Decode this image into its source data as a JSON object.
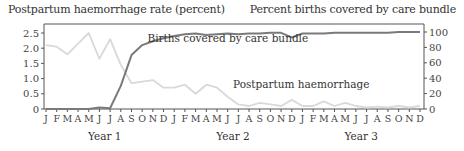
{
  "chart_data": {
    "type": "line",
    "title": "",
    "left_axis": {
      "label": "Postpartum haemorrhage rate (percent)",
      "ticks": [
        0,
        0.5,
        1.0,
        1.5,
        2.0,
        2.5
      ],
      "tick_labels": [
        "0",
        "0.5",
        "1.0",
        "1.5",
        "2.0",
        "2.5"
      ],
      "ylim": [
        0,
        2.6
      ]
    },
    "right_axis": {
      "label": "Percent births covered by care bundle",
      "ticks": [
        0,
        20,
        40,
        60,
        80,
        100
      ],
      "tick_labels": [
        "0",
        "20",
        "40",
        "60",
        "80",
        "100"
      ],
      "ylim": [
        0,
        104
      ]
    },
    "x": [
      "J",
      "F",
      "M",
      "A",
      "M",
      "J",
      "J",
      "A",
      "S",
      "O",
      "N",
      "D",
      "J",
      "F",
      "M",
      "A",
      "M",
      "J",
      "J",
      "A",
      "S",
      "O",
      "N",
      "D",
      "J",
      "F",
      "M",
      "A",
      "M",
      "J",
      "J",
      "A",
      "S",
      "O",
      "N",
      "D"
    ],
    "year_labels": [
      {
        "label": "Year 1",
        "month_index": 5.5
      },
      {
        "label": "Year 2",
        "month_index": 17.5
      },
      {
        "label": "Year 3",
        "month_index": 29.5
      }
    ],
    "series": [
      {
        "name": "Postpartum haemorrhage",
        "axis": "left",
        "color": "#d9d9d9",
        "values": [
          2.1,
          2.05,
          1.8,
          2.15,
          2.5,
          1.65,
          2.3,
          1.45,
          0.85,
          0.9,
          0.95,
          0.7,
          0.7,
          0.8,
          0.5,
          0.8,
          0.7,
          0.4,
          0.15,
          0.1,
          0.2,
          0.15,
          0.1,
          0.3,
          0.1,
          0.1,
          0.25,
          0.1,
          0.2,
          0.1,
          0.05,
          0.08,
          0.05,
          0.1,
          0.05,
          0.1
        ],
        "annotation": {
          "text": "Postpartum haemorrhage",
          "month_index": 17.5,
          "value_right_axis": 27
        }
      },
      {
        "name": "Births covered by care bundle",
        "axis": "right",
        "color": "#7a7a7a",
        "values": [
          0,
          0,
          0,
          0,
          0,
          2,
          1,
          30,
          70,
          83,
          88,
          92,
          95,
          97,
          98,
          96,
          97,
          98,
          97,
          98,
          98,
          99,
          99,
          93,
          98,
          98,
          98,
          99,
          99,
          99,
          99,
          99,
          99,
          100,
          100,
          100
        ],
        "annotation": {
          "text": "Births covered by care bundle",
          "month_index": 9.5,
          "value_right_axis": 87
        }
      }
    ],
    "grid": false,
    "legend": "inline annotations"
  },
  "colors": {
    "pph_line": "#d9d9d9",
    "coverage_line": "#7a7a7a",
    "axis": "#555555",
    "text": "#333333"
  }
}
